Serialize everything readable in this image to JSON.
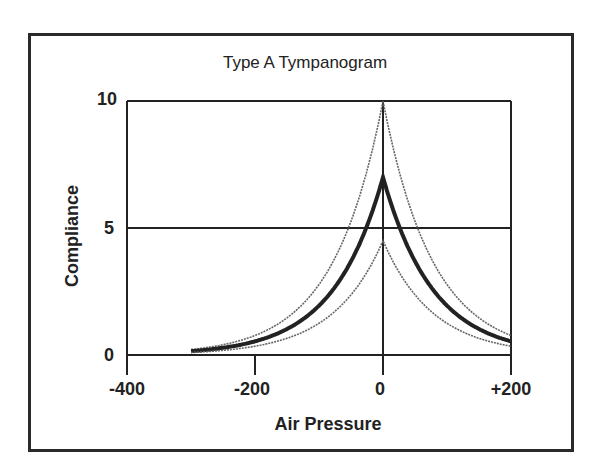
{
  "chart_data": {
    "type": "line",
    "title": "Type A Tympanogram",
    "xlabel": "Air Pressure",
    "ylabel": "Compliance",
    "xlim": [
      -400,
      200
    ],
    "ylim": [
      0,
      10
    ],
    "x_ticks": [
      "-400",
      "-200",
      "0",
      "+200"
    ],
    "y_ticks": [
      "0",
      "5",
      "10"
    ],
    "grid": "horizontal lines at 5 and 10; vertical line at 0",
    "legend": "none",
    "x": [
      -300,
      -250,
      -200,
      -150,
      -100,
      -50,
      -25,
      0,
      25,
      50,
      100,
      150,
      200
    ],
    "series": [
      {
        "name": "upper normal limit (thin)",
        "values": [
          0.21,
          0.41,
          0.77,
          1.46,
          2.77,
          5.26,
          7.25,
          10.0,
          7.25,
          5.26,
          2.77,
          1.46,
          0.77
        ]
      },
      {
        "name": "typical Type A (thick)",
        "values": [
          0.15,
          0.28,
          0.54,
          1.02,
          1.94,
          3.68,
          5.08,
          7.0,
          5.08,
          3.68,
          1.94,
          1.02,
          0.54
        ]
      },
      {
        "name": "lower normal limit (thin)",
        "values": [
          0.1,
          0.18,
          0.35,
          0.66,
          1.25,
          2.37,
          3.26,
          4.5,
          3.26,
          2.37,
          1.25,
          0.66,
          0.35
        ]
      }
    ]
  },
  "labels": {
    "title": "Type A Tympanogram",
    "xlabel": "Air Pressure",
    "ylabel": "Compliance",
    "xt0": "-400",
    "xt1": "-200",
    "xt2": "0",
    "xt3": "+200",
    "yt0": "0",
    "yt1": "5",
    "yt2": "10"
  },
  "colors": {
    "ink": "#222222",
    "thin": "#666666",
    "background": "#ffffff"
  }
}
